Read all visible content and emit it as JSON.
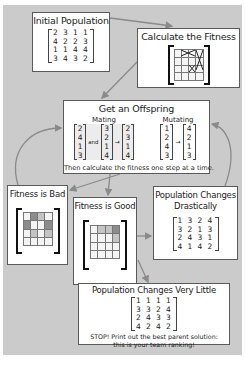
{
  "background_color": "#cbcbcb",
  "boxes": {
    "initial_population": {
      "title": "Initial Population",
      "matrix": [
        [
          "2",
          "3",
          "1",
          "1"
        ],
        [
          "4",
          "2",
          "2",
          "3"
        ],
        [
          "1",
          "1",
          "4",
          "4"
        ],
        [
          "3",
          "4",
          "3",
          "2"
        ]
      ]
    },
    "calculate_fitness": {
      "title": "Calculate the Fitness",
      "icon": "fitness-grid-with-crosses-icon"
    },
    "get_offspring": {
      "title": "Get an Offspring",
      "mating": {
        "label": "Mating",
        "parent_a": [
          "2",
          "4",
          "1",
          "3"
        ],
        "and_label": "and",
        "parent_b": [
          "3",
          "2",
          "1",
          "4"
        ],
        "child": [
          "2",
          "3",
          "1",
          "4"
        ]
      },
      "mutating": {
        "label": "Mutating",
        "before": [
          "1",
          "2",
          "4",
          "3"
        ],
        "after": [
          "4",
          "2",
          "1",
          "3"
        ]
      },
      "footer": "Then calculate the fitness one step at a time."
    },
    "fitness_bad": {
      "title": "Fitness is Bad",
      "shading": [
        [
          0,
          2,
          1,
          0
        ],
        [
          2,
          0,
          0,
          2
        ],
        [
          0,
          1,
          0,
          1
        ],
        [
          0,
          0,
          0,
          0
        ]
      ]
    },
    "fitness_good": {
      "title": "Fitness is Good",
      "shading": [
        [
          0,
          1,
          1,
          2
        ],
        [
          0,
          0,
          0,
          1
        ],
        [
          0,
          0,
          0,
          0
        ],
        [
          0,
          0,
          0,
          0
        ]
      ]
    },
    "changes_drastically": {
      "title_line1": "Population Changes",
      "title_line2": "Drastically",
      "matrix": [
        [
          "1",
          "3",
          "2",
          "4"
        ],
        [
          "3",
          "2",
          "1",
          "3"
        ],
        [
          "2",
          "4",
          "3",
          "1"
        ],
        [
          "4",
          "1",
          "4",
          "2"
        ]
      ]
    },
    "changes_little": {
      "title": "Population Changes Very Little",
      "matrix": [
        [
          "1",
          "1",
          "1",
          "1"
        ],
        [
          "3",
          "3",
          "2",
          "4"
        ],
        [
          "2",
          "4",
          "3",
          "3"
        ],
        [
          "4",
          "2",
          "4",
          "2"
        ]
      ],
      "footer_line1": "STOP! Print out the best parent solution:",
      "footer_line2": "this is your team ranking!"
    }
  },
  "shade_colors": [
    "#f4f4f4",
    "#c4c4c4",
    "#8c8c8c"
  ],
  "arrow_color": "#8a8a8a"
}
